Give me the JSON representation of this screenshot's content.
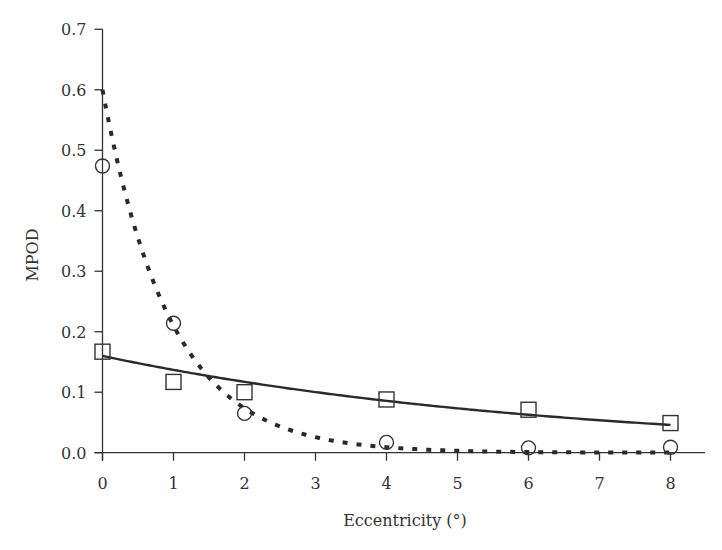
{
  "chart_data": {
    "type": "scatter",
    "title": "",
    "xlabel": "Eccentricity (°)",
    "ylabel": "MPOD",
    "xlim": [
      0,
      8.5
    ],
    "ylim": [
      0,
      0.7
    ],
    "xticks": [
      0,
      1,
      2,
      3,
      4,
      5,
      6,
      7,
      8
    ],
    "xtick_labels": [
      "0",
      "1",
      "2",
      "3",
      "4",
      "5",
      "6",
      "7",
      "8"
    ],
    "yticks": [
      0.0,
      0.1,
      0.2,
      0.3,
      0.4,
      0.5,
      0.6,
      0.7
    ],
    "ytick_labels": [
      "0.0",
      "0.1",
      "0.2",
      "0.3",
      "0.4",
      "0.5",
      "0.6",
      "0.7"
    ],
    "grid": false,
    "legend": null,
    "series": [
      {
        "name": "circles",
        "marker": "circle",
        "x": [
          0,
          1,
          2,
          4,
          6,
          8
        ],
        "y": [
          0.474,
          0.214,
          0.065,
          0.017,
          0.008,
          0.009
        ],
        "fit": {
          "style": "dashed",
          "model": "exponential",
          "a": 0.6,
          "k": 1.05
        }
      },
      {
        "name": "squares",
        "marker": "square",
        "x": [
          0,
          1,
          2,
          4,
          6,
          8
        ],
        "y": [
          0.167,
          0.117,
          0.1,
          0.088,
          0.071,
          0.049
        ],
        "fit": {
          "style": "solid",
          "model": "exponential",
          "a": 0.16,
          "k": 0.156
        }
      }
    ]
  }
}
